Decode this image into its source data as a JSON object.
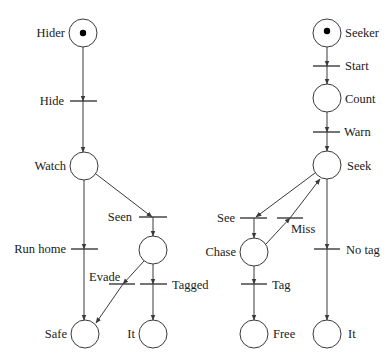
{
  "colors": {
    "stroke": "#3a3a3a",
    "text": "#1a1a1a",
    "token": "#000000"
  },
  "places": {
    "hider": "Hider",
    "watch": "Watch",
    "seen_place": "",
    "safe": "Safe",
    "it_left": "It",
    "seeker": "Seeker",
    "count": "Count",
    "seek": "Seek",
    "chase": "Chase",
    "free": "Free",
    "it_right": "It"
  },
  "transitions": {
    "hide": "Hide",
    "seen": "Seen",
    "run_home": "Run home",
    "evade": "Evade",
    "tagged": "Tagged",
    "start": "Start",
    "warn": "Warn",
    "see": "See",
    "miss": "Miss",
    "no_tag": "No tag",
    "tag": "Tag"
  },
  "tokens": {
    "hider": 1,
    "seeker": 1
  }
}
